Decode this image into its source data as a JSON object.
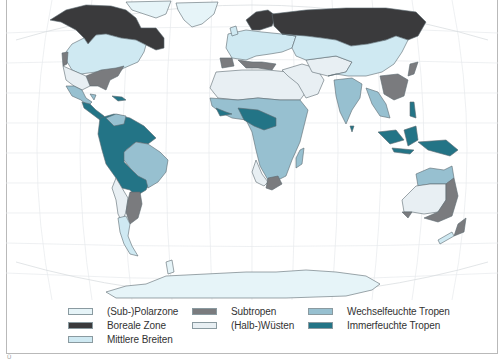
{
  "map": {
    "title": "Klimazonen der Erde",
    "colors": {
      "ocean": "#ffffff",
      "graticule": "#e6eaec",
      "outline": "#5c6a70",
      "polar": "#e6f4f8",
      "boreal": "#3a3a3c",
      "mid_latitudes": "#cfe9f2",
      "subtropics": "#7a7b7e",
      "deserts": "#e8eff3",
      "wet_dry_tropics": "#97c0d0",
      "rainforest": "#237486"
    }
  },
  "legend": {
    "items": [
      {
        "id": "polar",
        "label": "(Sub-)Polarzone",
        "color": "#e6f4f8"
      },
      {
        "id": "boreal",
        "label": "Boreale Zone",
        "color": "#3a3a3c"
      },
      {
        "id": "mid",
        "label": "Mittlere Breiten",
        "color": "#cfe9f2"
      },
      {
        "id": "subtropics",
        "label": "Subtropen",
        "color": "#7a7b7e"
      },
      {
        "id": "deserts",
        "label": "(Halb-)Wüsten",
        "color": "#e8eff3"
      },
      {
        "id": "wetdry",
        "label": "Wechselfeuchte Tropen",
        "color": "#97c0d0"
      },
      {
        "id": "rainforest",
        "label": "Immerfeuchte Tropen",
        "color": "#237486"
      }
    ]
  },
  "footer": {
    "corner_mark": "Ü"
  }
}
